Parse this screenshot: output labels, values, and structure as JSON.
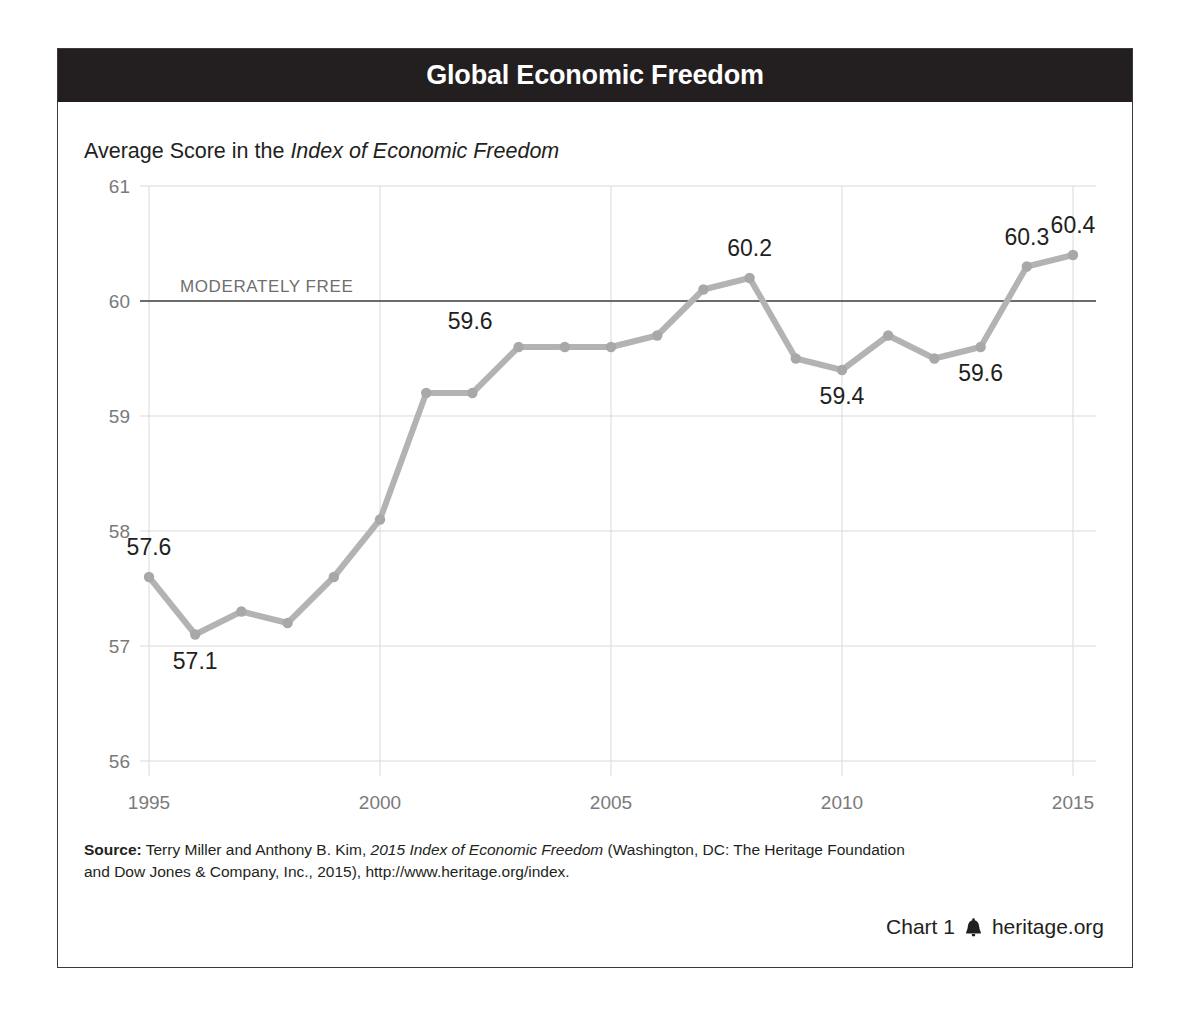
{
  "header": {
    "title": "Global Economic Freedom"
  },
  "subtitle": {
    "prefix": "Average Score in the ",
    "italic": "Index of Economic Freedom"
  },
  "annotation": {
    "moderately_free": "MODERATELY FREE",
    "threshold_value": 60
  },
  "source": {
    "label": "Source:",
    "line1_a": " Terry Miller and Anthony B. Kim, ",
    "line1_italic": "2015 Index of Economic Freedom",
    "line1_b": " (Washington, DC: The Heritage Foundation",
    "line2": "and Dow Jones & Company, Inc., 2015), http://www.heritage.org/index."
  },
  "footer": {
    "chart_number": "Chart 1",
    "icon": "liberty-bell-icon",
    "site": "heritage.org"
  },
  "colors": {
    "title_bar": "#231f20",
    "line": "#b3b3b3",
    "marker": "#a8a8a8",
    "gridline": "#d9d9d9",
    "threshold_line": "#3a3a3a",
    "text": "#231f20",
    "axis_label": "#7a7a7a"
  },
  "chart_data": {
    "type": "line",
    "title": "Global Economic Freedom",
    "subtitle": "Average Score in the Index of Economic Freedom",
    "xlabel": "",
    "ylabel": "",
    "x": [
      1995,
      1996,
      1997,
      1998,
      1999,
      2000,
      2001,
      2002,
      2003,
      2004,
      2005,
      2006,
      2007,
      2008,
      2009,
      2010,
      2011,
      2012,
      2013,
      2014,
      2015
    ],
    "values": [
      57.6,
      57.1,
      57.3,
      57.2,
      57.6,
      58.1,
      59.2,
      59.2,
      59.6,
      59.6,
      59.6,
      59.7,
      60.1,
      60.2,
      59.5,
      59.4,
      59.7,
      59.5,
      59.6,
      60.3,
      60.4
    ],
    "xlim": [
      1995,
      2015
    ],
    "ylim": [
      56,
      61
    ],
    "yticks": [
      56,
      57,
      58,
      59,
      60,
      61
    ],
    "ytick_labels": [
      "56",
      "57",
      "58",
      "59",
      "60",
      "61"
    ],
    "xticks": [
      1995,
      2000,
      2005,
      2010,
      2015
    ],
    "xtick_labels": [
      "1995",
      "2000",
      "2005",
      "2010",
      "2015"
    ],
    "grid": true,
    "legend": false,
    "point_labels": [
      {
        "x": 1995,
        "y": 57.6,
        "text": "57.6",
        "pos": "above"
      },
      {
        "x": 1996,
        "y": 57.1,
        "text": "57.1",
        "pos": "below"
      },
      {
        "x": 2003,
        "y": 59.6,
        "text": "59.6",
        "pos": "above-left"
      },
      {
        "x": 2008,
        "y": 60.2,
        "text": "60.2",
        "pos": "above"
      },
      {
        "x": 2010,
        "y": 59.4,
        "text": "59.4",
        "pos": "below"
      },
      {
        "x": 2013,
        "y": 59.6,
        "text": "59.6",
        "pos": "below"
      },
      {
        "x": 2014,
        "y": 60.3,
        "text": "60.3",
        "pos": "above"
      },
      {
        "x": 2015,
        "y": 60.4,
        "text": "60.4",
        "pos": "above"
      }
    ],
    "reference_lines": [
      {
        "y": 60,
        "label": "MODERATELY FREE"
      }
    ]
  }
}
